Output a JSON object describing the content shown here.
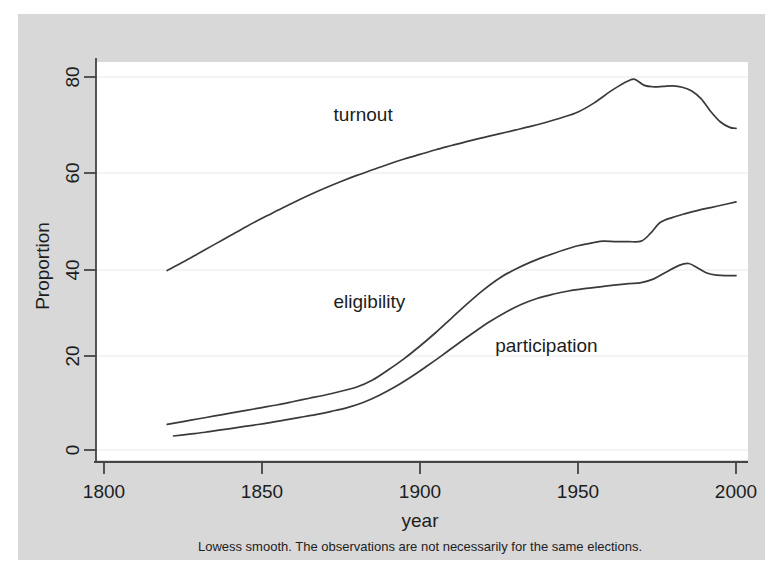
{
  "figure": {
    "background_color": "#d8d8d8",
    "plot_background_color": "#ffffff",
    "caption": "Lowess smooth. The observations are not necessarily for the same elections."
  },
  "chart_data": {
    "type": "line",
    "title": "",
    "subtitle": "",
    "xlabel": "year",
    "ylabel": "Proportion",
    "xlim": [
      1800,
      2005
    ],
    "ylim": [
      -3,
      84
    ],
    "xticks": [
      1800,
      1850,
      1900,
      1950,
      2000
    ],
    "xtick_labels": [
      "1800",
      "1850",
      "1900",
      "1950",
      "2000"
    ],
    "yticks": [
      0,
      20,
      40,
      60,
      80
    ],
    "ytick_labels": [
      "0",
      "20",
      "40",
      "60",
      "80"
    ],
    "grid": true,
    "grid_axis": "y",
    "legend": "inline-annotations",
    "annotations": [
      {
        "text": "turnout",
        "x": 1882,
        "y": 70.5
      },
      {
        "text": "eligibility",
        "x": 1884,
        "y": 30.5
      },
      {
        "text": "participation",
        "x": 1940,
        "y": 21.0
      }
    ],
    "series": [
      {
        "name": "turnout",
        "color": "#3a3a3a",
        "x": [
          1820,
          1825,
          1830,
          1835,
          1840,
          1845,
          1850,
          1855,
          1860,
          1865,
          1870,
          1875,
          1880,
          1885,
          1890,
          1895,
          1900,
          1905,
          1910,
          1915,
          1920,
          1925,
          1930,
          1935,
          1940,
          1945,
          1950,
          1955,
          1960,
          1963,
          1966,
          1968,
          1971,
          1974,
          1977,
          1980,
          1983,
          1986,
          1989,
          1992,
          1995,
          1998,
          2000
        ],
        "values": [
          38.5,
          40.3,
          42.2,
          44.1,
          46.0,
          47.9,
          49.7,
          51.4,
          53.1,
          54.7,
          56.2,
          57.6,
          58.9,
          60.1,
          61.3,
          62.4,
          63.4,
          64.4,
          65.3,
          66.2,
          67.0,
          67.8,
          68.6,
          69.4,
          70.3,
          71.3,
          72.5,
          74.4,
          76.8,
          78.1,
          79.2,
          79.5,
          78.2,
          77.9,
          78.0,
          78.1,
          77.8,
          77.0,
          75.3,
          72.6,
          70.4,
          69.2,
          69.0
        ]
      },
      {
        "name": "eligibility",
        "color": "#3a3a3a",
        "x": [
          1820,
          1825,
          1830,
          1835,
          1840,
          1845,
          1850,
          1855,
          1860,
          1865,
          1870,
          1875,
          1880,
          1885,
          1890,
          1895,
          1900,
          1905,
          1910,
          1915,
          1920,
          1925,
          1930,
          1935,
          1940,
          1945,
          1950,
          1955,
          1958,
          1962,
          1966,
          1970,
          1973,
          1976,
          1980,
          1984,
          1988,
          1992,
          1996,
          2000
        ],
        "values": [
          5.5,
          6.1,
          6.7,
          7.3,
          7.9,
          8.5,
          9.1,
          9.7,
          10.4,
          11.1,
          11.8,
          12.6,
          13.5,
          15.0,
          17.2,
          19.6,
          22.3,
          25.2,
          28.3,
          31.4,
          34.3,
          36.8,
          38.7,
          40.3,
          41.6,
          42.8,
          43.8,
          44.5,
          44.8,
          44.7,
          44.7,
          44.8,
          46.5,
          48.8,
          49.9,
          50.7,
          51.4,
          52.0,
          52.6,
          53.2
        ]
      },
      {
        "name": "participation",
        "color": "#6a6a6a",
        "x": [
          1822,
          1827,
          1832,
          1837,
          1842,
          1847,
          1852,
          1857,
          1862,
          1867,
          1872,
          1877,
          1882,
          1887,
          1892,
          1897,
          1902,
          1907,
          1912,
          1917,
          1922,
          1927,
          1932,
          1937,
          1942,
          1947,
          1952,
          1957,
          1962,
          1966,
          1970,
          1974,
          1978,
          1982,
          1985,
          1988,
          1991,
          1994,
          1997,
          2000
        ],
        "values": [
          3.0,
          3.4,
          3.8,
          4.3,
          4.8,
          5.3,
          5.8,
          6.4,
          7.0,
          7.6,
          8.3,
          9.1,
          10.2,
          11.7,
          13.5,
          15.6,
          17.9,
          20.3,
          22.8,
          25.2,
          27.5,
          29.5,
          31.2,
          32.5,
          33.4,
          34.1,
          34.6,
          35.0,
          35.4,
          35.7,
          35.9,
          36.7,
          38.2,
          39.6,
          40.0,
          39.0,
          37.9,
          37.5,
          37.4,
          37.4
        ]
      }
    ]
  }
}
